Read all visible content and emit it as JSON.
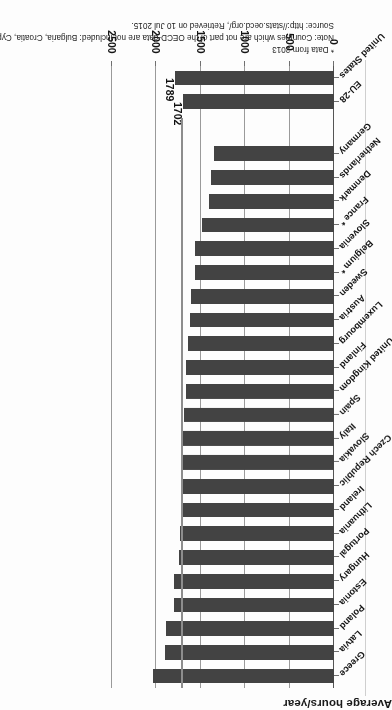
{
  "chart_data": {
    "type": "bar",
    "orientation": "horizontal",
    "title": "",
    "xlabel": "Average hours/year",
    "ylabel": "",
    "axis_title": "Average hours/year",
    "xlim": [
      0,
      2500
    ],
    "ticks": [
      0,
      500,
      1000,
      1500,
      2000,
      2500
    ],
    "tick_labels": [
      "0",
      "500",
      "1000",
      "1500",
      "2000",
      "2500"
    ],
    "grid": true,
    "legend": "none",
    "bar_color": "#434343",
    "reference_line": {
      "value": 1702,
      "label": "EU-28",
      "color": "#8d8d8d"
    },
    "categories": [
      "Greece",
      "Latvia",
      "Poland",
      "Estonia",
      "Hungary",
      "Portugal",
      "Lithuania",
      "Ireland",
      "Czech Republic",
      "Slovakia",
      "Italy",
      "Spain",
      "United Kingdom",
      "Finland",
      "Luxembourg",
      "Austria",
      "Sweden",
      "Belgium *",
      "Slovenia",
      "France *",
      "Denmark",
      "Netherlands",
      "Germany",
      "EU-28",
      "United States"
    ],
    "values": [
      2037,
      1903,
      1893,
      1806,
      1797,
      1740,
      1734,
      1726,
      1722,
      1713,
      1711,
      1691,
      1669,
      1666,
      1643,
      1623,
      1607,
      1570,
      1561,
      1489,
      1411,
      1380,
      1355,
      1702,
      1789
    ],
    "data_labels": {
      "United States": "1789",
      "EU-28": "1702"
    },
    "gap_before": [
      "EU-28"
    ]
  },
  "notes": {
    "line1": "* Data from 2013",
    "line2": "Note: Countries which are not part of the OECD-data are not included: Bulgaria, Croatia, Cyprus, Malta and Romania",
    "line3": "Source: http://stats.oecd.org/, Retrieved on 10 Jul 2015."
  }
}
